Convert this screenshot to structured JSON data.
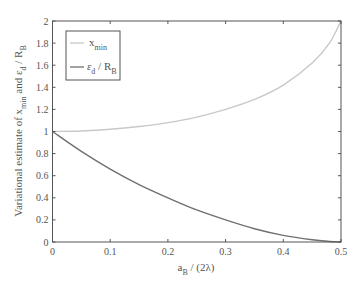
{
  "chart_data": {
    "type": "line",
    "title": "",
    "xlabel": "a_B / (2λ)",
    "ylabel": "Variational estimate of x_min and ε_d / R_B",
    "xlim": [
      0,
      0.5
    ],
    "ylim": [
      0,
      2
    ],
    "xticks": [
      0,
      0.1,
      0.2,
      0.3,
      0.4,
      0.5
    ],
    "yticks": [
      0,
      0.2,
      0.4,
      0.6,
      0.8,
      1,
      1.2,
      1.4,
      1.6,
      1.8,
      2
    ],
    "grid": false,
    "legend_position": "upper left",
    "x": [
      0,
      0.05,
      0.1,
      0.15,
      0.2,
      0.25,
      0.3,
      0.35,
      0.4,
      0.45,
      0.48,
      0.5
    ],
    "series": [
      {
        "name": "x_min",
        "color": "#c8c8c8",
        "values": [
          1.0,
          1.005,
          1.02,
          1.045,
          1.08,
          1.13,
          1.2,
          1.29,
          1.42,
          1.62,
          1.8,
          2.0
        ]
      },
      {
        "name": "ε_d / R_B",
        "color": "#707070",
        "values": [
          1.0,
          0.82,
          0.66,
          0.52,
          0.4,
          0.29,
          0.2,
          0.12,
          0.06,
          0.02,
          0.005,
          0.0
        ]
      }
    ]
  },
  "labels": {
    "xlabel_main": "a",
    "xlabel_sub": "B",
    "xlabel_rest": " / (2λ)",
    "ylabel_a": "Variational estimate of x",
    "ylabel_a_sub": "min",
    "ylabel_b": " and ε",
    "ylabel_b_sub": "d",
    "ylabel_c": " / R",
    "ylabel_c_sub": "B",
    "legend_1_main": "x",
    "legend_1_sub": "min",
    "legend_2_main": "ε",
    "legend_2_sub": "d",
    "legend_2_rest": " / R",
    "legend_2_sub2": "B"
  }
}
